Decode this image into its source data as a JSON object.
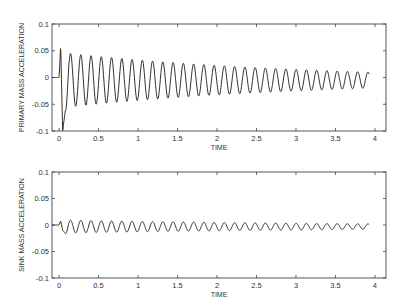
{
  "chart_data": [
    {
      "type": "line",
      "title": "",
      "xlabel": "TIME",
      "ylabel": "PRIMARY MASS ACCELERATION",
      "xlim": [
        -0.09,
        4.14
      ],
      "ylim": [
        -0.1,
        0.1
      ],
      "xticks": [
        0,
        0.5,
        1,
        1.5,
        2,
        2.5,
        3,
        3.5,
        4
      ],
      "xtick_labels": [
        "0",
        "0.5",
        "1",
        "1.5",
        "2",
        "2.5",
        "3",
        "3.5",
        "4"
      ],
      "yticks": [
        0.1,
        0.05,
        0,
        -0.05,
        -0.1
      ],
      "ytick_labels": [
        "0.1",
        "0.05",
        "0",
        "-0.05",
        "-0.1"
      ],
      "grid": false,
      "legend": null,
      "series": [
        {
          "name": "primary mass acceleration",
          "description": "Damped oscillation ~7.7 Hz; flat at 0 until t≈0, initial spike to +0.06 then -0.1, amplitude ~0.05 decaying to ~0.015 at t≈3.93",
          "frequency_hz": 7.7,
          "t_start": -0.09,
          "t_onset": 0.0,
          "t_end": 3.93,
          "initial_spike_max": 0.06,
          "initial_spike_min": -0.1,
          "amplitude_start": 0.05,
          "amplitude_end": 0.015,
          "offset": -0.005
        }
      ]
    },
    {
      "type": "line",
      "title": "",
      "xlabel": "TIME",
      "ylabel": "SINK MASS ACCELERATION",
      "xlim": [
        -0.09,
        4.14
      ],
      "ylim": [
        -0.1,
        0.1
      ],
      "xticks": [
        0,
        0.5,
        1,
        1.5,
        2,
        2.5,
        3,
        3.5,
        4
      ],
      "xtick_labels": [
        "0",
        "0.5",
        "1",
        "1.5",
        "2",
        "2.5",
        "3",
        "3.5",
        "4"
      ],
      "yticks": [
        0.1,
        0.05,
        0,
        -0.05,
        -0.1
      ],
      "ytick_labels": [
        "0.1",
        "0.05",
        "0",
        "-0.05",
        "-0.1"
      ],
      "grid": false,
      "legend": null,
      "series": [
        {
          "name": "sink mass acceleration",
          "description": "Small damped oscillation ~7.7 Hz; flat at 0 until t≈0, small bump, amplitude ~0.012 decaying to ~0.005 at t≈3.93",
          "frequency_hz": 7.7,
          "t_start": -0.09,
          "t_onset": 0.0,
          "t_end": 3.93,
          "initial_spike_max": 0.008,
          "initial_spike_min": -0.01,
          "amplitude_start": 0.012,
          "amplitude_end": 0.005,
          "offset": -0.003
        }
      ]
    }
  ],
  "plots": [
    {
      "ylabel": "PRIMARY MASS ACCELERATION",
      "xlabel": "TIME"
    },
    {
      "ylabel": "SINK MASS ACCELERATION",
      "xlabel": "TIME"
    }
  ]
}
